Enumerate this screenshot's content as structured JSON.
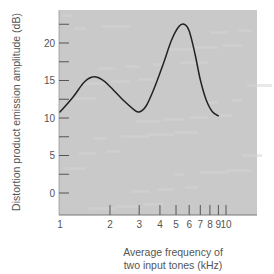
{
  "chart_data": {
    "type": "line",
    "title": "",
    "xlabel": "Average frequency of two input tones (kHz)",
    "xlabel_lines": [
      "Average frequency of",
      "two input tones  (kHz)"
    ],
    "ylabel": "Distortion product emission amplitude (dB)",
    "x_scale": "log",
    "xlim": [
      1,
      10
    ],
    "ylim": [
      -4,
      24
    ],
    "x_ticks": [
      1,
      2,
      3,
      4,
      5,
      6,
      7,
      8,
      9,
      10
    ],
    "x_tick_labels": [
      "1",
      "2",
      "3",
      "4",
      "5",
      "6",
      "7",
      "8",
      "9",
      "10"
    ],
    "y_ticks": [
      0,
      5,
      10,
      15,
      20
    ],
    "y_tick_labels": [
      "0",
      "5",
      "10",
      "15",
      "20"
    ],
    "y_minor_ticks": [
      2.5,
      7.5,
      12.5,
      17.5,
      22.5
    ],
    "grid": false,
    "background": "#c9c9c9",
    "line_color": "#222222",
    "series": [
      {
        "name": "Distortion product emission",
        "x": [
          1.0,
          1.2,
          1.4,
          1.6,
          1.8,
          2.0,
          2.4,
          2.8,
          3.0,
          3.3,
          3.7,
          4.2,
          4.7,
          5.2,
          5.6,
          6.0,
          6.5,
          7.0,
          7.6,
          8.3,
          9.0
        ],
        "y": [
          10.8,
          12.8,
          14.8,
          15.5,
          15.1,
          14.2,
          12.4,
          11.1,
          10.8,
          11.6,
          14.0,
          17.3,
          20.4,
          22.2,
          22.5,
          21.6,
          18.6,
          15.1,
          12.4,
          10.8,
          10.3
        ]
      }
    ]
  }
}
